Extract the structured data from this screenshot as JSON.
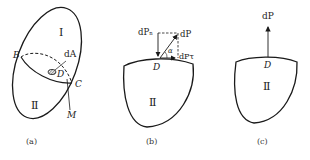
{
  "figure_a": {
    "caption": "(a)",
    "region_I": "Ⅰ",
    "region_II": "Ⅱ",
    "label_B": "B",
    "label_C": "C",
    "label_D": "D",
    "label_M": "M",
    "label_dA": "dA"
  },
  "figure_b": {
    "caption": "(b)",
    "region_II": "Ⅱ",
    "label_D": "D",
    "label_dP": "dP",
    "label_dPn": "dPₙ",
    "label_dPt": "dPτ",
    "label_alpha": "α"
  },
  "figure_c": {
    "caption": "(c)",
    "region_II": "Ⅱ",
    "label_D": "D",
    "label_dP": "dP"
  },
  "colors": {
    "stroke": "#1a1a1a",
    "background": "#ffffff"
  }
}
